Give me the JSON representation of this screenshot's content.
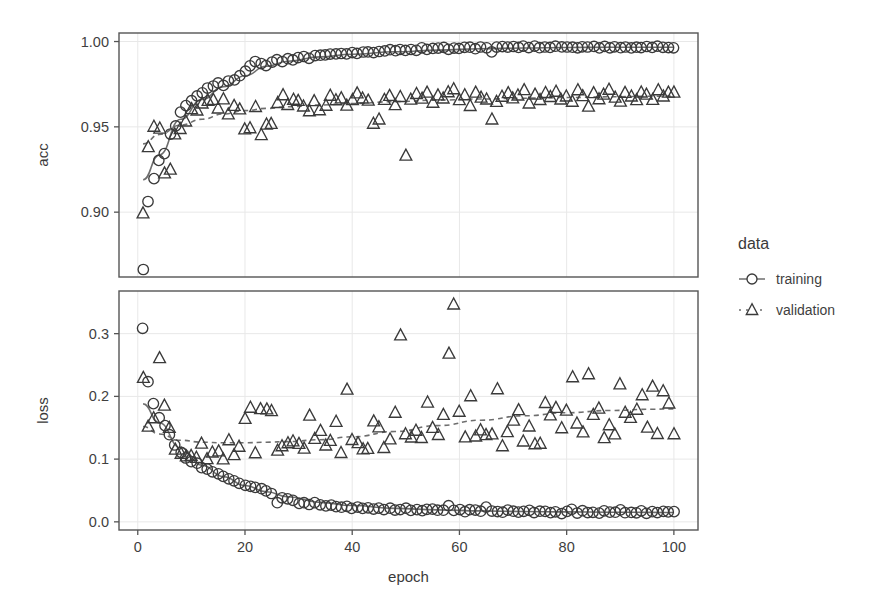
{
  "figure": {
    "background": "#ffffff",
    "panel_border_color": "#555555",
    "grid_color": "#e8e8e8",
    "marker_color": "#3a3a3a",
    "smooth_line_color": "#6e6e6e"
  },
  "legend": {
    "title": "data",
    "position": "right",
    "entries": [
      {
        "label": "training",
        "marker": "circle-icon",
        "line": "solid"
      },
      {
        "label": "validation",
        "marker": "triangle-icon",
        "line": "dashed"
      }
    ]
  },
  "axis": {
    "xlabel": "epoch",
    "x_ticks": [
      "0",
      "20",
      "40",
      "60",
      "80",
      "100"
    ],
    "x_tick_values": [
      0,
      20,
      40,
      60,
      80,
      100
    ],
    "xlim": [
      -3.5,
      104.5
    ]
  },
  "chart_data": [
    {
      "type": "scatter",
      "panel": "acc",
      "title": "",
      "xlabel": "epoch",
      "ylabel": "acc",
      "ylim": [
        0.862,
        1.005
      ],
      "y_ticks": [
        0.9,
        0.95,
        1.0
      ],
      "y_tick_labels": [
        "0.90",
        "0.95",
        "1.00"
      ],
      "grid": true,
      "legend_position": "right",
      "x": [
        1,
        2,
        3,
        4,
        5,
        6,
        7,
        8,
        9,
        10,
        11,
        12,
        13,
        14,
        15,
        16,
        17,
        18,
        19,
        20,
        21,
        22,
        23,
        24,
        25,
        26,
        27,
        28,
        29,
        30,
        31,
        32,
        33,
        34,
        35,
        36,
        37,
        38,
        39,
        40,
        41,
        42,
        43,
        44,
        45,
        46,
        47,
        48,
        49,
        50,
        51,
        52,
        53,
        54,
        55,
        56,
        57,
        58,
        59,
        60,
        61,
        62,
        63,
        64,
        65,
        66,
        67,
        68,
        69,
        70,
        71,
        72,
        73,
        74,
        75,
        76,
        77,
        78,
        79,
        80,
        81,
        82,
        83,
        84,
        85,
        86,
        87,
        88,
        89,
        90,
        91,
        92,
        93,
        94,
        95,
        96,
        97,
        98,
        99,
        100
      ],
      "series": [
        {
          "name": "training",
          "marker": "circle",
          "line": "solid",
          "values": [
            0.8665,
            0.9065,
            0.9195,
            0.9305,
            0.9345,
            0.9455,
            0.9505,
            0.9585,
            0.9625,
            0.9655,
            0.968,
            0.97,
            0.973,
            0.974,
            0.9755,
            0.9745,
            0.977,
            0.9775,
            0.98,
            0.9825,
            0.986,
            0.9885,
            0.987,
            0.986,
            0.988,
            0.989,
            0.9885,
            0.99,
            0.9895,
            0.9905,
            0.991,
            0.9905,
            0.9915,
            0.992,
            0.992,
            0.9925,
            0.9925,
            0.993,
            0.9925,
            0.9935,
            0.993,
            0.994,
            0.994,
            0.9935,
            0.9945,
            0.9945,
            0.995,
            0.9945,
            0.9955,
            0.995,
            0.9955,
            0.995,
            0.996,
            0.9955,
            0.996,
            0.996,
            0.9965,
            0.9955,
            0.9965,
            0.996,
            0.9965,
            0.9965,
            0.996,
            0.997,
            0.9965,
            0.994,
            0.9965,
            0.997,
            0.9965,
            0.997,
            0.9965,
            0.997,
            0.9965,
            0.997,
            0.9965,
            0.997,
            0.9965,
            0.997,
            0.9965,
            0.997,
            0.9965,
            0.9965,
            0.997,
            0.9965,
            0.997,
            0.9965,
            0.997,
            0.9965,
            0.997,
            0.9965,
            0.997,
            0.9965,
            0.997,
            0.9965,
            0.997,
            0.9965,
            0.997,
            0.9965,
            0.9965,
            0.9965
          ],
          "smooth": {
            "x": [
              1,
              4,
              8,
              12,
              16,
              20,
              24,
              28,
              34,
              40,
              48,
              56,
              64,
              72,
              80,
              88,
              96,
              100
            ],
            "y": [
              0.919,
              0.9335,
              0.9545,
              0.966,
              0.9735,
              0.98,
              0.9855,
              0.9885,
              0.991,
              0.9925,
              0.994,
              0.995,
              0.9958,
              0.9962,
              0.9965,
              0.9966,
              0.9967,
              0.9967
            ]
          }
        },
        {
          "name": "validation",
          "marker": "triangle",
          "line": "dashed",
          "values": [
            0.8995,
            0.9385,
            0.95,
            0.949,
            0.9225,
            0.925,
            0.9455,
            0.949,
            0.9535,
            0.9605,
            0.96,
            0.9635,
            0.965,
            0.966,
            0.9605,
            0.966,
            0.9575,
            0.9625,
            0.96,
            0.9485,
            0.949,
            0.962,
            0.945,
            0.9515,
            0.952,
            0.964,
            0.9685,
            0.963,
            0.966,
            0.9655,
            0.962,
            0.9595,
            0.9655,
            0.96,
            0.9625,
            0.968,
            0.966,
            0.967,
            0.9625,
            0.966,
            0.97,
            0.967,
            0.9655,
            0.952,
            0.9545,
            0.9655,
            0.968,
            0.9625,
            0.9675,
            0.9335,
            0.966,
            0.969,
            0.9665,
            0.97,
            0.964,
            0.9685,
            0.9665,
            0.97,
            0.972,
            0.966,
            0.9685,
            0.9625,
            0.97,
            0.967,
            0.966,
            0.9545,
            0.965,
            0.968,
            0.97,
            0.9665,
            0.9685,
            0.9715,
            0.964,
            0.969,
            0.966,
            0.97,
            0.9675,
            0.9705,
            0.966,
            0.968,
            0.9645,
            0.9715,
            0.968,
            0.962,
            0.97,
            0.966,
            0.969,
            0.9715,
            0.9675,
            0.9645,
            0.97,
            0.968,
            0.9655,
            0.9705,
            0.969,
            0.966,
            0.9715,
            0.968,
            0.97,
            0.9705
          ],
          "smooth": {
            "x": [
              1,
              4,
              8,
              12,
              16,
              20,
              24,
              28,
              34,
              40,
              48,
              56,
              64,
              72,
              80,
              88,
              96,
              100
            ],
            "y": [
              0.94,
              0.9455,
              0.951,
              0.9545,
              0.9575,
              0.9595,
              0.9608,
              0.9618,
              0.9628,
              0.9637,
              0.9648,
              0.9657,
              0.9663,
              0.9668,
              0.9672,
              0.9676,
              0.9679,
              0.968
            ]
          }
        }
      ]
    },
    {
      "type": "scatter",
      "panel": "loss",
      "title": "",
      "xlabel": "epoch",
      "ylabel": "loss",
      "ylim": [
        -0.013,
        0.368
      ],
      "y_ticks": [
        0.0,
        0.1,
        0.2,
        0.3
      ],
      "y_tick_labels": [
        "0.0",
        "0.1",
        "0.2",
        "0.3"
      ],
      "grid": true,
      "legend_position": "right",
      "x": [
        1,
        2,
        3,
        4,
        5,
        6,
        7,
        8,
        9,
        10,
        11,
        12,
        13,
        14,
        15,
        16,
        17,
        18,
        19,
        20,
        21,
        22,
        23,
        24,
        25,
        26,
        27,
        28,
        29,
        30,
        31,
        32,
        33,
        34,
        35,
        36,
        37,
        38,
        39,
        40,
        41,
        42,
        43,
        44,
        45,
        46,
        47,
        48,
        49,
        50,
        51,
        52,
        53,
        54,
        55,
        56,
        57,
        58,
        59,
        60,
        61,
        62,
        63,
        64,
        65,
        66,
        67,
        68,
        69,
        70,
        71,
        72,
        73,
        74,
        75,
        76,
        77,
        78,
        79,
        80,
        81,
        82,
        83,
        84,
        85,
        86,
        87,
        88,
        89,
        90,
        91,
        92,
        93,
        94,
        95,
        96,
        97,
        98,
        99,
        100
      ],
      "series": [
        {
          "name": "training",
          "marker": "circle",
          "line": "solid",
          "values": [
            0.308,
            0.224,
            0.188,
            0.166,
            0.153,
            0.138,
            0.123,
            0.111,
            0.101,
            0.096,
            0.093,
            0.087,
            0.084,
            0.08,
            0.076,
            0.072,
            0.068,
            0.066,
            0.062,
            0.058,
            0.057,
            0.054,
            0.052,
            0.05,
            0.046,
            0.03,
            0.039,
            0.036,
            0.034,
            0.029,
            0.03,
            0.028,
            0.03,
            0.027,
            0.025,
            0.026,
            0.024,
            0.023,
            0.025,
            0.022,
            0.024,
            0.022,
            0.023,
            0.021,
            0.022,
            0.02,
            0.021,
            0.019,
            0.02,
            0.021,
            0.019,
            0.02,
            0.018,
            0.019,
            0.02,
            0.018,
            0.019,
            0.025,
            0.018,
            0.019,
            0.017,
            0.02,
            0.018,
            0.017,
            0.024,
            0.018,
            0.017,
            0.016,
            0.018,
            0.017,
            0.015,
            0.016,
            0.018,
            0.015,
            0.016,
            0.017,
            0.015,
            0.016,
            0.014,
            0.016,
            0.02,
            0.015,
            0.017,
            0.015,
            0.016,
            0.014,
            0.017,
            0.015,
            0.016,
            0.02,
            0.014,
            0.016,
            0.015,
            0.017,
            0.014,
            0.016,
            0.015,
            0.016,
            0.015,
            0.0155
          ],
          "smooth": {
            "x": [
              1,
              4,
              8,
              12,
              16,
              20,
              24,
              28,
              34,
              40,
              48,
              56,
              64,
              72,
              80,
              88,
              96,
              100
            ],
            "y": [
              0.188,
              0.158,
              0.118,
              0.09,
              0.072,
              0.058,
              0.048,
              0.04,
              0.031,
              0.026,
              0.0215,
              0.019,
              0.0175,
              0.0165,
              0.0158,
              0.0153,
              0.015,
              0.0149
            ]
          }
        },
        {
          "name": "validation",
          "marker": "triangle",
          "line": "dashed",
          "values": [
            0.229,
            0.153,
            0.165,
            0.262,
            0.186,
            0.15,
            0.115,
            0.109,
            0.104,
            0.106,
            0.102,
            0.124,
            0.1,
            0.111,
            0.113,
            0.1,
            0.13,
            0.107,
            0.12,
            0.164,
            0.183,
            0.11,
            0.179,
            0.18,
            0.177,
            0.114,
            0.12,
            0.125,
            0.128,
            0.125,
            0.117,
            0.17,
            0.132,
            0.145,
            0.121,
            0.13,
            0.16,
            0.11,
            0.211,
            0.13,
            0.125,
            0.115,
            0.117,
            0.16,
            0.15,
            0.118,
            0.132,
            0.175,
            0.298,
            0.14,
            0.135,
            0.145,
            0.133,
            0.19,
            0.15,
            0.138,
            0.17,
            0.268,
            0.347,
            0.176,
            0.135,
            0.2,
            0.136,
            0.147,
            0.138,
            0.14,
            0.212,
            0.12,
            0.144,
            0.162,
            0.178,
            0.129,
            0.152,
            0.124,
            0.125,
            0.19,
            0.17,
            0.182,
            0.15,
            0.178,
            0.23,
            0.156,
            0.142,
            0.235,
            0.17,
            0.18,
            0.134,
            0.155,
            0.14,
            0.22,
            0.175,
            0.165,
            0.178,
            0.202,
            0.15,
            0.215,
            0.14,
            0.209,
            0.188,
            0.14
          ],
          "smooth": {
            "x": [
              1,
              4,
              8,
              12,
              16,
              20,
              24,
              28,
              34,
              40,
              48,
              56,
              64,
              72,
              80,
              88,
              96,
              100
            ],
            "y": [
              0.152,
              0.14,
              0.13,
              0.127,
              0.126,
              0.126,
              0.127,
              0.128,
              0.131,
              0.1355,
              0.144,
              0.1535,
              0.162,
              0.169,
              0.174,
              0.1775,
              0.1795,
              0.18
            ]
          }
        }
      ]
    }
  ]
}
